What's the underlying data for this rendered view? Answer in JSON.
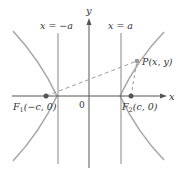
{
  "diagram": {
    "type": "hyperbola-foci",
    "labels": {
      "y_axis": "y",
      "x_axis": "x",
      "origin": "0",
      "left_directrix": "x = −a",
      "right_directrix": "x = a",
      "point_p": "P(x, y)",
      "focus_1_name": "F",
      "focus_1_sub": "1",
      "focus_1_coords": "(−c, 0)",
      "focus_2_name": "F",
      "focus_2_sub": "2",
      "focus_2_coords": "(c, 0)"
    },
    "colors": {
      "curve": "#a8a8a8",
      "axis": "#555555",
      "directrix": "#888888",
      "dashed": "#9a9a9a",
      "point": "#555555",
      "text": "#333333"
    }
  }
}
